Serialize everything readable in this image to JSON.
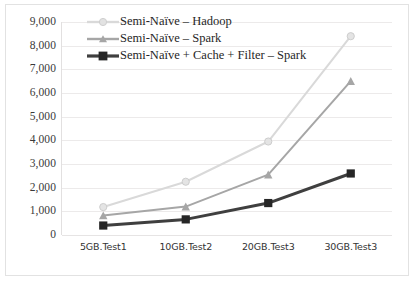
{
  "chart_data": {
    "type": "line",
    "title": "",
    "subtitle": "",
    "xlabel": "",
    "ylabel": "",
    "categories": [
      "5GB.Test1",
      "10GB.Test2",
      "20GB.Test3",
      "30GB.Test3"
    ],
    "series": [
      {
        "name": "Semi-Naïve – Hadoop",
        "values": [
          1180,
          2250,
          3950,
          8400
        ],
        "color": "#d9d9d9",
        "marker": "circle"
      },
      {
        "name": "Semi-Naïve – Spark",
        "values": [
          820,
          1200,
          2550,
          6500
        ],
        "color": "#a6a6a6",
        "marker": "triangle"
      },
      {
        "name": "Semi-Naïve + Cache + Filter – Spark",
        "values": [
          400,
          660,
          1350,
          2600
        ],
        "color": "#3f3f3f",
        "marker": "square"
      }
    ],
    "ylim": [
      0,
      9000
    ],
    "ytick_step": 1000,
    "ytick_labels": [
      "9,000",
      "8,000",
      "7,000",
      "6,000",
      "5,000",
      "4,000",
      "3,000",
      "2,000",
      "1,000",
      "0"
    ],
    "ytick_values": [
      9000,
      8000,
      7000,
      6000,
      5000,
      4000,
      3000,
      2000,
      1000,
      0
    ],
    "grid": true,
    "grid_color": "#eceaea",
    "legend_position": "top-left-inside",
    "plot_background": "#ffffff",
    "frame_color": "#e2e2e2"
  },
  "legend": {
    "items": [
      {
        "label": "Semi-Naïve – Hadoop"
      },
      {
        "label": "Semi-Naïve – Spark"
      },
      {
        "label": "Semi-Naïve + Cache + Filter – Spark"
      }
    ]
  }
}
